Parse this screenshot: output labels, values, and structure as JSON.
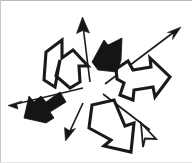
{
  "canvas": {
    "title": "Radiating Arrows Sketch",
    "width": 192,
    "height": 163,
    "background_color": "#ffffff",
    "border_color": "#b8b8b8",
    "ink_color": "#151515"
  },
  "legend": {
    "solid_label": "solid filled arrow",
    "outline_label": "outlined arrow",
    "line_label": "thin line arrow"
  },
  "arrows": [
    {
      "id": "outline-arrow-upper-left",
      "style": "outline",
      "direction": "up-left",
      "label": "Outlined arrow pointing up-left",
      "angle_deg": 315
    },
    {
      "id": "thin-arrow-up",
      "style": "line",
      "direction": "up",
      "label": "Thin line arrow pointing up",
      "angle_deg": 270
    },
    {
      "id": "solid-arrow-up-right",
      "style": "solid",
      "direction": "down-left",
      "label": "Solid black arrow head pointing down-left",
      "angle_deg": 205
    },
    {
      "id": "thin-arrow-up-right",
      "style": "line",
      "direction": "up-right",
      "label": "Long thin line arrow pointing up-right",
      "angle_deg": 330
    },
    {
      "id": "outline-arrow-right",
      "style": "outline",
      "direction": "right",
      "label": "Outlined arrow pointing right",
      "angle_deg": 0
    },
    {
      "id": "thin-arrow-down-right",
      "style": "line-open-head",
      "direction": "down-right",
      "label": "Thin line arrow with open head pointing down-right",
      "angle_deg": 40
    },
    {
      "id": "outline-arrow-down",
      "style": "outline",
      "direction": "down",
      "label": "Outlined arrow pointing down",
      "angle_deg": 95
    },
    {
      "id": "thin-arrow-down-left",
      "style": "line",
      "direction": "down-left",
      "label": "Thin line arrow pointing down-left",
      "angle_deg": 115
    },
    {
      "id": "solid-arrow-left",
      "style": "solid",
      "direction": "down-left",
      "label": "Thick solid black arrow pointing down-left",
      "angle_deg": 200
    },
    {
      "id": "thin-arrow-left",
      "style": "line",
      "direction": "left",
      "label": "Thin line arrow pointing left",
      "angle_deg": 180
    }
  ]
}
